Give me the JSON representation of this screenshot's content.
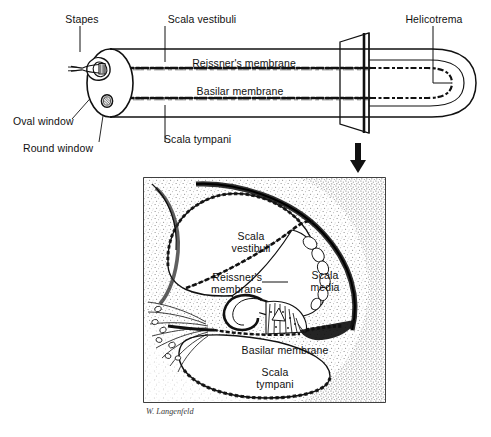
{
  "figure": {
    "artist_signature": "W. Langenfeld"
  },
  "colors": {
    "ink": "#111111",
    "paper": "#ffffff",
    "stipple": "#6f6f6f",
    "membrane": "#222222"
  },
  "top_diagram": {
    "name": "uncoiled-cochlea",
    "labels": {
      "stapes": "Stapes",
      "scala_vestibuli": "Scala vestibuli",
      "helicotrema": "Helicotrema",
      "reissners_membrane": "Reissner's membrane",
      "basilar_membrane": "Basilar membrane",
      "oval_window": "Oval window",
      "round_window": "Round window",
      "scala_tympani": "Scala tympani"
    }
  },
  "transition": {
    "name": "section-arrow",
    "glyph": "down-arrow"
  },
  "cross_section": {
    "name": "cochlear-duct-cross-section",
    "labels": {
      "scala_vestibuli_line1": "Scala",
      "scala_vestibuli_line2": "vestibuli",
      "reissners_line1": "Reissner's",
      "reissners_line2": "membrane",
      "scala_media_line1": "Scala",
      "scala_media_line2": "media",
      "basilar_membrane": "Basilar membrane",
      "scala_tympani_line1": "Scala",
      "scala_tympani_line2": "tympani"
    }
  }
}
